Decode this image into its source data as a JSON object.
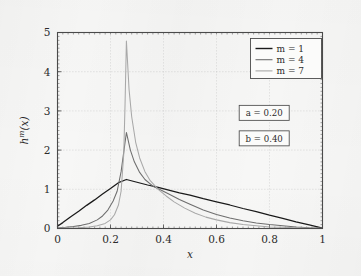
{
  "figure": {
    "background_color": "#f7f7f6",
    "axes_color": "#4a4a4a",
    "grid_color": "#bdbdbd"
  },
  "chart_data": {
    "type": "line",
    "title": "",
    "xlabel": "x",
    "ylabel": "h^m(x)",
    "xlim": [
      0,
      1
    ],
    "ylim": [
      0,
      5
    ],
    "xticks": [
      0,
      0.2,
      0.4,
      0.6,
      0.8,
      1
    ],
    "xticklabels": [
      "0",
      "0.2",
      "0.4",
      "0.6",
      "0.8",
      "1"
    ],
    "yticks": [
      0,
      1,
      2,
      3,
      4,
      5
    ],
    "yticklabels": [
      "0",
      "1",
      "2",
      "3",
      "4",
      "5"
    ],
    "grid": true,
    "legend_position": "upper right",
    "series": [
      {
        "name": "m = 1",
        "color": "#1a1a1a",
        "peak_x": 0.26,
        "peak_y": 1.25,
        "x": [
          0.0,
          0.02,
          0.05,
          0.08,
          0.11,
          0.14,
          0.17,
          0.2,
          0.23,
          0.26,
          0.3,
          0.34,
          0.38,
          0.42,
          0.46,
          0.5,
          0.55,
          0.6,
          0.65,
          0.7,
          0.75,
          0.8,
          0.85,
          0.9,
          0.95,
          1.0
        ],
        "y": [
          0.06,
          0.15,
          0.3,
          0.44,
          0.59,
          0.73,
          0.88,
          1.02,
          1.17,
          1.25,
          1.18,
          1.11,
          1.05,
          0.98,
          0.91,
          0.85,
          0.76,
          0.68,
          0.6,
          0.51,
          0.43,
          0.34,
          0.26,
          0.17,
          0.09,
          0.01
        ]
      },
      {
        "name": "m = 4",
        "color": "#6e6e6e",
        "peak_x": 0.26,
        "peak_y": 2.45,
        "x": [
          0.0,
          0.03,
          0.06,
          0.09,
          0.12,
          0.15,
          0.17,
          0.19,
          0.21,
          0.225,
          0.24,
          0.25,
          0.26,
          0.275,
          0.29,
          0.31,
          0.33,
          0.36,
          0.39,
          0.42,
          0.46,
          0.5,
          0.55,
          0.6,
          0.65,
          0.7,
          0.75,
          0.8,
          0.85,
          0.9,
          0.95,
          1.0
        ],
        "y": [
          0.02,
          0.03,
          0.05,
          0.08,
          0.13,
          0.22,
          0.32,
          0.47,
          0.7,
          0.95,
          1.45,
          1.95,
          2.45,
          2.0,
          1.7,
          1.43,
          1.25,
          1.08,
          0.98,
          0.88,
          0.74,
          0.62,
          0.47,
          0.36,
          0.27,
          0.2,
          0.14,
          0.1,
          0.07,
          0.04,
          0.02,
          0.01
        ]
      },
      {
        "name": "m = 7",
        "color": "#a8a8a8",
        "peak_x": 0.26,
        "peak_y": 4.78,
        "x": [
          0.0,
          0.04,
          0.08,
          0.12,
          0.15,
          0.18,
          0.2,
          0.215,
          0.23,
          0.24,
          0.25,
          0.255,
          0.26,
          0.27,
          0.28,
          0.295,
          0.31,
          0.33,
          0.35,
          0.38,
          0.41,
          0.44,
          0.48,
          0.52,
          0.56,
          0.6,
          0.65,
          0.7,
          0.75,
          0.8,
          0.85,
          0.9,
          0.95,
          1.0
        ],
        "y": [
          0.01,
          0.01,
          0.02,
          0.04,
          0.07,
          0.13,
          0.22,
          0.35,
          0.6,
          0.95,
          1.9,
          3.2,
          4.78,
          3.55,
          2.85,
          2.2,
          1.8,
          1.45,
          1.22,
          1.0,
          0.83,
          0.68,
          0.52,
          0.39,
          0.29,
          0.22,
          0.15,
          0.1,
          0.07,
          0.04,
          0.03,
          0.02,
          0.01,
          0.0
        ]
      }
    ],
    "annotations": [
      {
        "name": "parameter-a",
        "text": "a = 0.20",
        "x_frac": 0.78,
        "y_frac": 0.41
      },
      {
        "name": "parameter-b",
        "text": "b = 0.40",
        "x_frac": 0.78,
        "y_frac": 0.54
      }
    ]
  }
}
